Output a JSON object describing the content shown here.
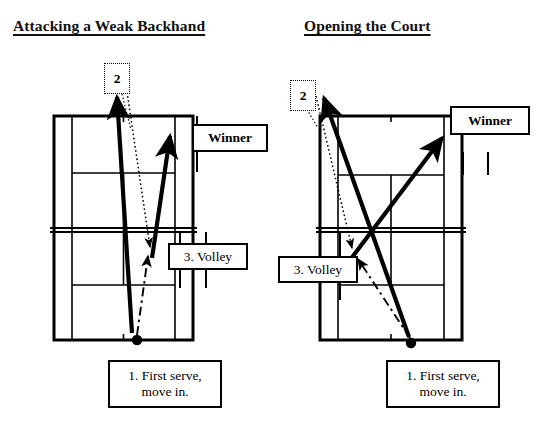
{
  "page": {
    "background": "#ffffff",
    "ink": "#000000",
    "width": 556,
    "height": 431
  },
  "diagrams": [
    {
      "id": "left",
      "title": "Attacking a Weak Backhand",
      "labels": {
        "step2": "2",
        "winner": "Winner",
        "volley": "3. Volley",
        "serve_line1": "1. First serve,",
        "serve_line2": "move in."
      }
    },
    {
      "id": "right",
      "title": "Opening the Court",
      "labels": {
        "step2": "2",
        "winner": "Winner",
        "volley": "3. Volley",
        "serve_line1": "1. First serve,",
        "serve_line2": "move in."
      }
    }
  ],
  "legend": {
    "solid_arrow_meaning": "ball path",
    "dashed_arrow_meaning": "player movement",
    "dotted_arrow_meaning": "opponent return"
  }
}
